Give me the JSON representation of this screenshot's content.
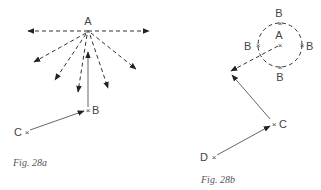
{
  "figures": [
    {
      "caption": "Fig. 28a",
      "points": {
        "A": {
          "label": "A",
          "x": 88,
          "y": 31
        },
        "B": {
          "label": "B",
          "x": 88,
          "y": 110
        },
        "C": {
          "label": "C",
          "x": 26,
          "y": 132
        }
      },
      "marker": "×"
    },
    {
      "caption": "Fig. 28b",
      "points": {
        "A": {
          "label": "A",
          "x": 280,
          "y": 45
        },
        "B_top": {
          "label": "B",
          "x": 280,
          "y": 23
        },
        "B_left": {
          "label": "B",
          "x": 258,
          "y": 45
        },
        "B_right": {
          "label": "B",
          "x": 302,
          "y": 45
        },
        "B_bottom": {
          "label": "B",
          "x": 280,
          "y": 67
        },
        "C": {
          "label": "C",
          "x": 274,
          "y": 124
        },
        "D": {
          "label": "D",
          "x": 213,
          "y": 157
        }
      },
      "marker": "×"
    }
  ]
}
